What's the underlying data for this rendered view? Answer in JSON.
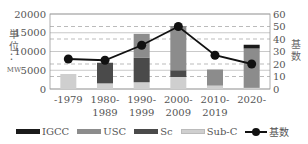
{
  "chart_data": {
    "type": "bar",
    "subtype": "stacked-bar-with-line",
    "categories": [
      "-1979",
      "1980-\n1989",
      "1990-\n1999",
      "2000-\n2009",
      "2010-\n2019",
      "2020-"
    ],
    "category_lines": [
      [
        "-1979",
        ""
      ],
      [
        "1980-",
        "1989"
      ],
      [
        "1990-",
        "1999"
      ],
      [
        "2000-",
        "2009"
      ],
      [
        "2010-",
        "2019"
      ],
      [
        "2020-",
        ""
      ]
    ],
    "series": [
      {
        "name": "Sub-C",
        "type": "bar",
        "axis": "left",
        "color": "#cfcfcf",
        "values": [
          4000,
          1500,
          1800,
          3200,
          900,
          300
        ]
      },
      {
        "name": "Sc",
        "type": "bar",
        "axis": "left",
        "color": "#4a4a4a",
        "values": [
          0,
          5500,
          6500,
          1800,
          0,
          0
        ]
      },
      {
        "name": "USC",
        "type": "bar",
        "axis": "left",
        "color": "#8c8c8c",
        "values": [
          0,
          0,
          6400,
          11800,
          4300,
          10500
        ]
      },
      {
        "name": "IGCC",
        "type": "bar",
        "axis": "left",
        "color": "#1a1a1a",
        "values": [
          0,
          0,
          0,
          0,
          0,
          1000
        ]
      },
      {
        "name": "基数",
        "type": "line",
        "axis": "right",
        "color": "#111111",
        "values": [
          24,
          23,
          35,
          50,
          27,
          20
        ]
      }
    ],
    "title": "",
    "xlabel": "",
    "ylabel": "単位：MW",
    "ylabel_lines": [
      "単",
      "位",
      "：",
      "MW"
    ],
    "y2label": "基数",
    "y2label_lines": [
      "基",
      "数"
    ],
    "ylim": [
      0,
      20000
    ],
    "y2lim": [
      0,
      60
    ],
    "yticks": [
      "0",
      "5000",
      "10000",
      "15000",
      "20000"
    ],
    "y2ticks": [
      "0",
      "10",
      "20",
      "30",
      "40",
      "50",
      "60"
    ],
    "grid": true,
    "legend_position": "bottom",
    "legend": [
      "IGCC",
      "USC",
      "Sc",
      "Sub-C",
      "基数"
    ]
  },
  "legend": {
    "items": [
      {
        "label": "IGCC",
        "color": "#1a1a1a"
      },
      {
        "label": "USC",
        "color": "#8c8c8c"
      },
      {
        "label": "Sc",
        "color": "#4a4a4a"
      },
      {
        "label": "Sub-C",
        "color": "#cfcfcf"
      }
    ],
    "line_label": "基数"
  }
}
